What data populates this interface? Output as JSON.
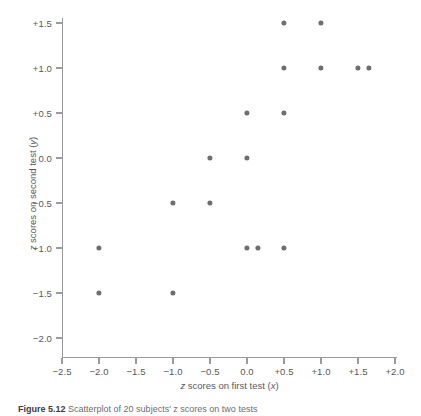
{
  "figure": {
    "caption_label": "Figure",
    "caption_number": "5.12",
    "caption_text": "Scatterplot of 20 subjects' z scores on two tests"
  },
  "chart_data": {
    "type": "scatter",
    "title": "",
    "xlabel": "z scores on first test (x)",
    "ylabel": "z scores on second test (y)",
    "xlabel_parts": {
      "lead": "z",
      "rest": " scores on first test (",
      "var": "x",
      "tail": ")"
    },
    "ylabel_parts": {
      "lead": "z",
      "rest": " scores on second test (",
      "var": "y",
      "tail": ")"
    },
    "xlim": [
      -2.5,
      2.0
    ],
    "ylim": [
      -2.0,
      1.5
    ],
    "xticks": [
      -2.5,
      -2.0,
      -1.5,
      -1.0,
      -0.5,
      0.0,
      0.5,
      1.0,
      1.5,
      2.0
    ],
    "yticks": [
      -2.0,
      -1.5,
      -1.0,
      -0.5,
      0.0,
      0.5,
      1.0,
      1.5
    ],
    "xticklabels": [
      "−2.5",
      "−2.0",
      "−1.5",
      "−1.0",
      "−0.5",
      "0.0",
      "+0.5",
      "+1.0",
      "+1.5",
      "+2.0"
    ],
    "yticklabels": [
      "−2.0",
      "−1.5",
      "−1.0",
      "−0.5",
      "0.0",
      "+0.5",
      "+1.0",
      "+1.5"
    ],
    "grid": false,
    "legend": null,
    "marker_color": "#6d6e71",
    "axis_color": "#9a9b9e",
    "marker_size": 5.2,
    "points": [
      {
        "x": 0.5,
        "y": 1.5
      },
      {
        "x": 1.0,
        "y": 1.5
      },
      {
        "x": 0.5,
        "y": 1.0
      },
      {
        "x": 1.0,
        "y": 1.0
      },
      {
        "x": 1.5,
        "y": 1.0
      },
      {
        "x": 1.65,
        "y": 1.0
      },
      {
        "x": 0.0,
        "y": 0.5
      },
      {
        "x": 0.5,
        "y": 0.5
      },
      {
        "x": -0.5,
        "y": 0.0
      },
      {
        "x": 0.0,
        "y": 0.0
      },
      {
        "x": -1.0,
        "y": -0.5
      },
      {
        "x": -0.5,
        "y": -0.5
      },
      {
        "x": -2.0,
        "y": -1.0
      },
      {
        "x": 0.0,
        "y": -1.0
      },
      {
        "x": 0.15,
        "y": -1.0
      },
      {
        "x": 0.5,
        "y": -1.0
      },
      {
        "x": -2.0,
        "y": -1.5
      },
      {
        "x": -1.0,
        "y": -1.5
      }
    ],
    "n_points": 18
  }
}
